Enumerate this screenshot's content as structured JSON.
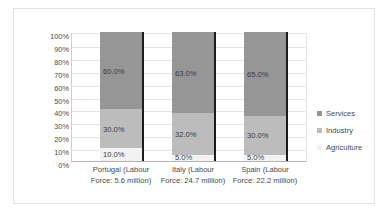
{
  "chart_data": {
    "type": "bar",
    "subtype": "100% stacked column",
    "title": "",
    "xlabel": "",
    "ylabel": "",
    "ylim": [
      0,
      100
    ],
    "grid": true,
    "legend_position": "right",
    "categories": [
      "Portugal (Labour Force: 5.6 million)",
      "Italy (Labour Force: 24.7 million)",
      "Spain  (Labour Force: 22.2 million)"
    ],
    "category_lines": [
      [
        "Portugal (Labour",
        "Force: 5.6 million)"
      ],
      [
        "Italy (Labour",
        "Force: 24.7 million)"
      ],
      [
        "Spain  (Labour",
        "Force: 22.2 million)"
      ]
    ],
    "ytick_labels": [
      "100%",
      "90%",
      "80%",
      "70%",
      "60%",
      "50%",
      "40%",
      "30%",
      "20%",
      "10%",
      "0%"
    ],
    "ytick_values": [
      100,
      90,
      80,
      70,
      60,
      50,
      40,
      30,
      20,
      10,
      0
    ],
    "series": [
      {
        "name": "Services",
        "values": [
          60.0,
          63.0,
          65.0
        ],
        "labels": [
          "60.0%",
          "63.0%",
          "65.0%"
        ],
        "color": "#969696"
      },
      {
        "name": "Industry",
        "values": [
          30.0,
          32.0,
          30.0
        ],
        "labels": [
          "30.0%",
          "32.0%",
          "30.0%"
        ],
        "color": "#bcbcbc"
      },
      {
        "name": "Agriculture",
        "values": [
          10.0,
          5.0,
          5.0
        ],
        "labels": [
          "10.0%",
          "5.0%",
          "5.0%"
        ],
        "color": "#f2f2f2"
      }
    ]
  },
  "legend": {
    "items": [
      {
        "label": "Services"
      },
      {
        "label": "Industry"
      },
      {
        "label": "Agriculture"
      }
    ]
  },
  "colors": {
    "services": "#969696",
    "industry": "#bcbcbc",
    "agriculture": "#f2f2f2",
    "bar_edge": "#1c1c1c",
    "gridline": "#e4e4e4",
    "frame": "#e2e2e2",
    "text": "#4a4a4a",
    "background": "#ffffff"
  }
}
